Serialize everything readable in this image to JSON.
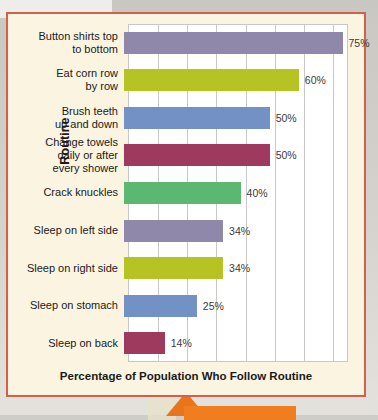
{
  "figure": {
    "background_color": "#faf4e1",
    "border_color": "#d2604c",
    "plot_background_color": "#ffffff",
    "gridline_color": "#c9c9c9"
  },
  "chart_data": {
    "type": "bar",
    "orientation": "horizontal",
    "title": "",
    "xlabel": "Percentage of Population Who Follow Routine",
    "ylabel": "Routine",
    "xlim": [
      0,
      75.5
    ],
    "grid": true,
    "grid_step": 10,
    "legend": "none",
    "categories": [
      "Button shirts top to bottom",
      "Eat corn row by row",
      "Brush teeth up and down",
      "Change towels daily or after every shower",
      "Crack knuckles",
      "Sleep on left side",
      "Sleep on right side",
      "Sleep on stomach",
      "Sleep on back"
    ],
    "values": [
      75,
      60,
      50,
      50,
      40,
      34,
      34,
      25,
      14
    ],
    "value_labels": [
      "75%",
      "60%",
      "50%",
      "50%",
      "40%",
      "34%",
      "34%",
      "25%",
      "14%"
    ],
    "bar_colors": [
      "#8f88aa",
      "#b5c423",
      "#7391c4",
      "#9e3a5e",
      "#5cb870",
      "#8f88aa",
      "#b5c423",
      "#7391c4",
      "#9e3a5e"
    ],
    "category_lines": [
      [
        "Button shirts top",
        "to bottom"
      ],
      [
        "Eat corn row",
        "by row"
      ],
      [
        "Brush teeth",
        "up and down"
      ],
      [
        "Change towels",
        "daily or after",
        "every shower"
      ],
      [
        "Crack knuckles"
      ],
      [
        "Sleep on left side"
      ],
      [
        "Sleep on right side"
      ],
      [
        "Sleep on stomach"
      ],
      [
        "Sleep on back"
      ]
    ]
  },
  "callout": {
    "color": "#f07d20"
  }
}
